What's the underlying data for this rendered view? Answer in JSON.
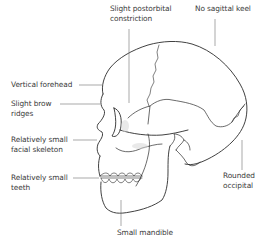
{
  "diagram": {
    "colors": {
      "background": "#ffffff",
      "outline": "#2b2b2b",
      "leader_line": "#6e6e6e",
      "text": "#3a3a3a",
      "shading": "#d8d8d8"
    },
    "labels": [
      {
        "id": "postorbital",
        "lines": [
          "Slight postorbital",
          "constriction"
        ]
      },
      {
        "id": "sagittal",
        "lines": [
          "No sagittal keel"
        ]
      },
      {
        "id": "forehead",
        "lines": [
          "Vertical forehead"
        ]
      },
      {
        "id": "brow",
        "lines": [
          "Slight brow",
          "ridges"
        ]
      },
      {
        "id": "facial",
        "lines": [
          "Relatively small",
          "facial skeleton"
        ]
      },
      {
        "id": "teeth",
        "lines": [
          "Relatively small",
          "teeth"
        ]
      },
      {
        "id": "occipital",
        "lines": [
          "Rounded",
          "occipital"
        ]
      },
      {
        "id": "mandible",
        "lines": [
          "Small mandible"
        ]
      }
    ]
  }
}
